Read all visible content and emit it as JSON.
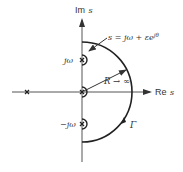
{
  "diagram": {
    "type": "nyquist-contour",
    "axes": {
      "imag_label_prefix": "Im",
      "imag_label_var": "s",
      "real_label_prefix": "Re",
      "real_label_var": "s"
    },
    "labels": {
      "indent_equation": "s = jω + εe",
      "indent_exponent": "jθ",
      "upper_pole": "jω",
      "lower_pole": "−jω",
      "radius": "R → ∞",
      "contour": "Γ"
    },
    "poles": [
      "left-real-axis",
      "origin",
      "upper-imag-axis",
      "lower-imag-axis"
    ],
    "colors": {
      "stroke": "#333333",
      "axis": "#555555",
      "background": "#ffffff"
    }
  }
}
